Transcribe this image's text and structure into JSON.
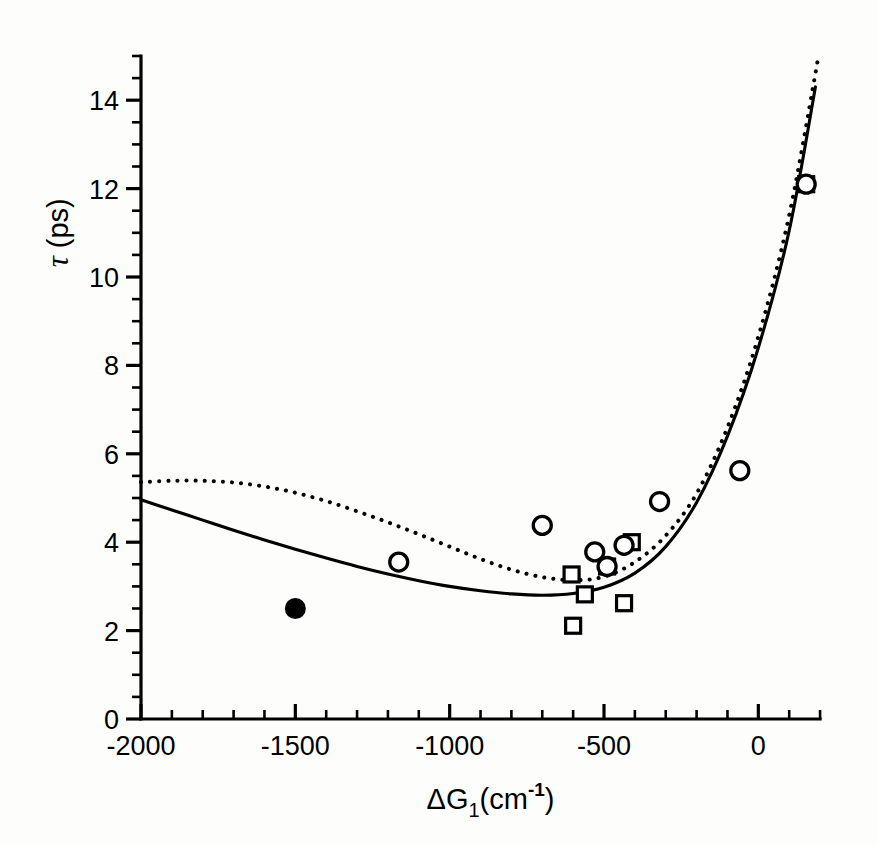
{
  "figure": {
    "background_color": "#fdfdfc",
    "ink_color": "#000000"
  },
  "chart_data": {
    "type": "scatter",
    "title": "",
    "subtitle": "",
    "xlabel": "ΔG₁(cm⁻¹)",
    "xlabel_parts": {
      "delta_g": "ΔG",
      "subscript": "1",
      "open_paren": "(cm",
      "superscript": "-1",
      "close_paren": ")"
    },
    "ylabel": "τ (ps)",
    "ylabel_parts": {
      "tau": "τ",
      "units": "(ps)"
    },
    "xlim": [
      -2000,
      200
    ],
    "ylim": [
      0,
      15
    ],
    "grid": false,
    "legend": "none",
    "x_major_ticks": [
      -2000,
      -1500,
      -1000,
      -500,
      0
    ],
    "x_major_tick_labels": [
      "-2000",
      "-1500",
      "-1000",
      "-500",
      "0"
    ],
    "x_minor_tick_step": 100,
    "y_major_ticks": [
      0,
      2,
      4,
      6,
      8,
      10,
      12,
      14
    ],
    "y_major_tick_labels": [
      "0",
      "2",
      "4",
      "6",
      "8",
      "10",
      "12",
      "14"
    ],
    "y_minor_tick_step": 0.5,
    "series": [
      {
        "name": "open-circles",
        "marker": "open-circle",
        "points": [
          {
            "x": -1165,
            "y": 3.55
          },
          {
            "x": -700,
            "y": 4.38
          },
          {
            "x": -530,
            "y": 3.78
          },
          {
            "x": -490,
            "y": 3.45
          },
          {
            "x": -435,
            "y": 3.93
          },
          {
            "x": -320,
            "y": 4.92
          },
          {
            "x": -60,
            "y": 5.62
          },
          {
            "x": 155,
            "y": 12.1
          }
        ]
      },
      {
        "name": "open-squares",
        "marker": "open-square",
        "points": [
          {
            "x": -605,
            "y": 3.27
          },
          {
            "x": -600,
            "y": 2.11
          },
          {
            "x": -562,
            "y": 2.82
          },
          {
            "x": -490,
            "y": 3.45
          },
          {
            "x": -435,
            "y": 2.62
          },
          {
            "x": -410,
            "y": 4.0
          },
          {
            "x": 155,
            "y": 12.1
          }
        ]
      },
      {
        "name": "filled-circle",
        "marker": "filled-circle",
        "points": [
          {
            "x": -1500,
            "y": 2.5
          }
        ]
      },
      {
        "name": "solid-curve",
        "style": "solid-line",
        "points": [
          {
            "x": -2000,
            "y": 4.96
          },
          {
            "x": -1900,
            "y": 4.73
          },
          {
            "x": -1800,
            "y": 4.5
          },
          {
            "x": -1700,
            "y": 4.27
          },
          {
            "x": -1600,
            "y": 4.05
          },
          {
            "x": -1500,
            "y": 3.84
          },
          {
            "x": -1400,
            "y": 3.64
          },
          {
            "x": -1300,
            "y": 3.45
          },
          {
            "x": -1200,
            "y": 3.28
          },
          {
            "x": -1100,
            "y": 3.13
          },
          {
            "x": -1000,
            "y": 3.0
          },
          {
            "x": -900,
            "y": 2.9
          },
          {
            "x": -800,
            "y": 2.83
          },
          {
            "x": -700,
            "y": 2.8
          },
          {
            "x": -600,
            "y": 2.84
          },
          {
            "x": -500,
            "y": 2.98
          },
          {
            "x": -400,
            "y": 3.3
          },
          {
            "x": -300,
            "y": 3.9
          },
          {
            "x": -200,
            "y": 4.9
          },
          {
            "x": -100,
            "y": 6.4
          },
          {
            "x": 0,
            "y": 8.4
          },
          {
            "x": 100,
            "y": 11.05
          },
          {
            "x": 185,
            "y": 14.3
          }
        ]
      },
      {
        "name": "dotted-curve",
        "style": "dotted-line",
        "points": [
          {
            "x": -2000,
            "y": 5.36
          },
          {
            "x": -1900,
            "y": 5.39
          },
          {
            "x": -1800,
            "y": 5.39
          },
          {
            "x": -1700,
            "y": 5.35
          },
          {
            "x": -1600,
            "y": 5.26
          },
          {
            "x": -1500,
            "y": 5.12
          },
          {
            "x": -1400,
            "y": 4.93
          },
          {
            "x": -1300,
            "y": 4.7
          },
          {
            "x": -1200,
            "y": 4.45
          },
          {
            "x": -1100,
            "y": 4.18
          },
          {
            "x": -1000,
            "y": 3.9
          },
          {
            "x": -900,
            "y": 3.62
          },
          {
            "x": -800,
            "y": 3.38
          },
          {
            "x": -700,
            "y": 3.21
          },
          {
            "x": -600,
            "y": 3.14
          },
          {
            "x": -500,
            "y": 3.22
          },
          {
            "x": -400,
            "y": 3.55
          },
          {
            "x": -300,
            "y": 4.15
          },
          {
            "x": -200,
            "y": 5.1
          },
          {
            "x": -100,
            "y": 6.6
          },
          {
            "x": 0,
            "y": 8.65
          },
          {
            "x": 100,
            "y": 11.4
          },
          {
            "x": 195,
            "y": 15.0
          }
        ]
      }
    ]
  }
}
